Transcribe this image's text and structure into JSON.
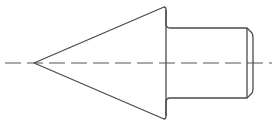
{
  "drawing": {
    "subject": "conical pin with cylindrical shank",
    "colors": {
      "outline": "#4a4a4a",
      "centerline": "#555555",
      "background": "#ffffff"
    },
    "centerline": {
      "x1": 5,
      "x2": 272,
      "y": 63
    },
    "cone": {
      "tip": [
        34,
        63
      ],
      "base_top": [
        164,
        7
      ],
      "base_bottom": [
        166,
        119
      ]
    },
    "shank": {
      "top_y": 28,
      "bottom_y": 98,
      "start_x": 172,
      "end_x": 247,
      "chamfer_x": 253
    }
  }
}
